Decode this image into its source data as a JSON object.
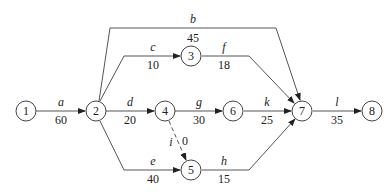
{
  "diagram": {
    "type": "activity-on-arrow network",
    "nodes": [
      {
        "id": "1",
        "label": "1",
        "x": 26,
        "y": 111
      },
      {
        "id": "2",
        "label": "2",
        "x": 96,
        "y": 111
      },
      {
        "id": "3",
        "label": "3",
        "x": 191,
        "y": 56
      },
      {
        "id": "4",
        "label": "4",
        "x": 165,
        "y": 111
      },
      {
        "id": "5",
        "label": "5",
        "x": 191,
        "y": 170
      },
      {
        "id": "6",
        "label": "6",
        "x": 233,
        "y": 111
      },
      {
        "id": "7",
        "label": "7",
        "x": 302,
        "y": 111
      },
      {
        "id": "8",
        "label": "8",
        "x": 372,
        "y": 111
      }
    ],
    "edges": [
      {
        "id": "a",
        "name": "a",
        "duration": "60",
        "from": "1",
        "to": "2",
        "dashed": false
      },
      {
        "id": "b",
        "name": "b",
        "duration": "45",
        "from": "2",
        "to": "7",
        "dashed": false
      },
      {
        "id": "c",
        "name": "c",
        "duration": "10",
        "from": "2",
        "to": "3",
        "dashed": false
      },
      {
        "id": "d",
        "name": "d",
        "duration": "20",
        "from": "2",
        "to": "4",
        "dashed": false
      },
      {
        "id": "e",
        "name": "e",
        "duration": "40",
        "from": "2",
        "to": "5",
        "dashed": false
      },
      {
        "id": "f",
        "name": "f",
        "duration": "18",
        "from": "3",
        "to": "7",
        "dashed": false
      },
      {
        "id": "g",
        "name": "g",
        "duration": "30",
        "from": "4",
        "to": "6",
        "dashed": false
      },
      {
        "id": "i",
        "name": "i",
        "duration": "0",
        "from": "4",
        "to": "5",
        "dashed": true
      },
      {
        "id": "h",
        "name": "h",
        "duration": "15",
        "from": "5",
        "to": "7",
        "dashed": false
      },
      {
        "id": "k",
        "name": "k",
        "duration": "25",
        "from": "6",
        "to": "7",
        "dashed": false
      },
      {
        "id": "l",
        "name": "l",
        "duration": "35",
        "from": "7",
        "to": "8",
        "dashed": false
      }
    ]
  }
}
